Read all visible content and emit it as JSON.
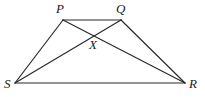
{
  "diagram": {
    "type": "trapezium-with-diagonals",
    "vertices": {
      "P": {
        "label": "P",
        "x": 63,
        "y": 20,
        "lx": 56,
        "ly": 13
      },
      "Q": {
        "label": "Q",
        "x": 121,
        "y": 20,
        "lx": 116,
        "ly": 13
      },
      "R": {
        "label": "R",
        "x": 185,
        "y": 83,
        "lx": 189,
        "ly": 88
      },
      "S": {
        "label": "S",
        "x": 15,
        "y": 83,
        "lx": 4,
        "ly": 88
      },
      "X": {
        "label": "X",
        "x": 95,
        "y": 35,
        "lx": 89,
        "ly": 49
      }
    },
    "edges": [
      {
        "name": "side-PQ",
        "from": "P",
        "to": "Q"
      },
      {
        "name": "side-QR",
        "from": "Q",
        "to": "R"
      },
      {
        "name": "side-RS",
        "from": "R",
        "to": "S"
      },
      {
        "name": "side-SP",
        "from": "S",
        "to": "P"
      },
      {
        "name": "diagonal-PR",
        "from": "P",
        "to": "R"
      },
      {
        "name": "diagonal-QS",
        "from": "Q",
        "to": "S"
      }
    ],
    "stroke_color": "#2a2a2a",
    "label_color": "#1a1a1a"
  }
}
